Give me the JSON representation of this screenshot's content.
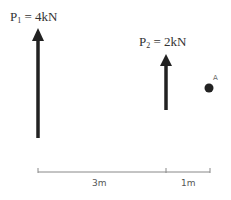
{
  "forces": [
    {
      "name": "P",
      "subscript": "1",
      "value": " = 4kN",
      "x_m": 0,
      "direction": "up"
    },
    {
      "name": "P",
      "subscript": "2",
      "value": " = 2kN",
      "x_m": 3,
      "direction": "up"
    }
  ],
  "point": {
    "label": "A",
    "x_m": 4
  },
  "dimensions": [
    {
      "label": "3m",
      "from_m": 0,
      "to_m": 3
    },
    {
      "label": "1m",
      "from_m": 3,
      "to_m": 4
    }
  ],
  "colors": {
    "arrow": "#222222",
    "dimension_line": "#888888",
    "text": "#333333"
  }
}
